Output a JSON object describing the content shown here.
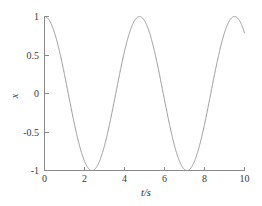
{
  "figure": {
    "background_color": "#ffffff",
    "axis_color": "#8a8a8a",
    "curve_color": "#9a9a9a",
    "text_color": "#3a3a3a"
  },
  "axes": {
    "x_title": "t/s",
    "y_title": "x",
    "x_ticks": [
      "0",
      "2",
      "4",
      "6",
      "8",
      "10"
    ],
    "y_ticks": [
      "1",
      "0.5",
      "0",
      "-0.5",
      "-1"
    ]
  },
  "chart_data": {
    "type": "line",
    "title": "",
    "subtitle": "",
    "xlabel": "t/s",
    "ylabel": "x",
    "xlim": [
      0,
      10
    ],
    "ylim": [
      -1,
      1
    ],
    "xticks": [
      0,
      2,
      4,
      6,
      8,
      10
    ],
    "yticks": [
      -1,
      -0.5,
      0,
      0.5,
      1
    ],
    "grid": false,
    "legend": null,
    "legend_position": "none",
    "annotations": [],
    "amplitude": 1,
    "period": 4.75,
    "omega": 1.3228,
    "phase": 0,
    "series": [
      {
        "name": "x(t)",
        "color": "#9a9a9a",
        "x": [
          0,
          0.2,
          0.4,
          0.6,
          0.8,
          1,
          1.2,
          1.4,
          1.6,
          1.8,
          2,
          2.2,
          2.4,
          2.6,
          2.8,
          3,
          3.2,
          3.4,
          3.6,
          3.8,
          4,
          4.2,
          4.4,
          4.6,
          4.8,
          5,
          5.2,
          5.4,
          5.6,
          5.8,
          6,
          6.2,
          6.4,
          6.6,
          6.8,
          7,
          7.2,
          7.4,
          7.6,
          7.8,
          8,
          8.2,
          8.4,
          8.6,
          8.8,
          9,
          9.2,
          9.4,
          9.6,
          9.8,
          10
        ],
        "y": [
          1,
          0.965,
          0.862,
          0.701,
          0.492,
          0.25,
          -0.009,
          -0.266,
          -0.505,
          -0.71,
          -0.867,
          -0.967,
          -1,
          -0.963,
          -0.858,
          -0.695,
          -0.484,
          -0.241,
          0.018,
          0.275,
          0.513,
          0.716,
          0.871,
          0.969,
          1,
          0.961,
          0.854,
          0.689,
          0.477,
          0.232,
          -0.027,
          -0.284,
          -0.521,
          -0.723,
          -0.876,
          -0.971,
          -0.999,
          -0.958,
          -0.849,
          -0.683,
          -0.469,
          -0.223,
          0.036,
          0.293,
          0.528,
          0.729,
          0.88,
          0.973,
          0.999,
          0.956,
          0.845
        ]
      }
    ]
  }
}
